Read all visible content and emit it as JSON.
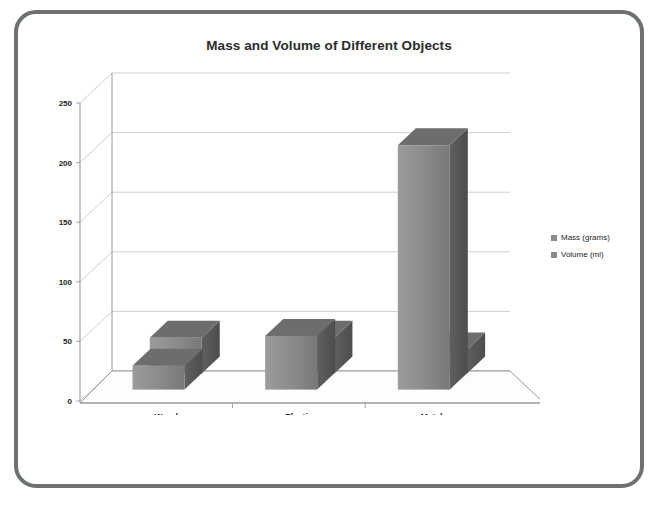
{
  "frame": {
    "border_color": "#6e7173",
    "background": "#ffffff"
  },
  "chart_title": "Mass and Volume of Different Objects",
  "legend": {
    "position": "right",
    "items": [
      {
        "label": "Mass (grams)",
        "color": "#8b8b8b"
      },
      {
        "label": "Volume (ml)",
        "color": "#8b8b8b"
      }
    ]
  },
  "axes": {
    "y_ticks": [
      "0",
      "50",
      "100",
      "150",
      "200",
      "250"
    ],
    "x_ticks": [
      "Wood",
      "Plastic",
      "Metal"
    ],
    "ylim": [
      0,
      250
    ],
    "grid": true
  },
  "colors": {
    "bar_front": "#8b8b8b",
    "bar_side": "#5b5b5b",
    "bar_top": "#707070",
    "grid_line": "#c9c9c9",
    "axis_line": "#9a9a9a",
    "floor": "#fdfdfd",
    "text": "#1d1d1d"
  },
  "chart_data": {
    "type": "bar",
    "title": "Mass and Volume of Different Objects",
    "xlabel": "",
    "ylabel": "",
    "categories": [
      "Wood",
      "Plastic",
      "Metal"
    ],
    "series": [
      {
        "name": "Mass (grams)",
        "values": [
          20,
          45,
          205
        ]
      },
      {
        "name": "Volume (ml)",
        "values": [
          30,
          30,
          20
        ]
      }
    ],
    "ylim": [
      0,
      250
    ],
    "yticks": [
      0,
      50,
      100,
      150,
      200,
      250
    ],
    "grid": true,
    "legend_position": "right",
    "style": "3d-clustered-column"
  }
}
